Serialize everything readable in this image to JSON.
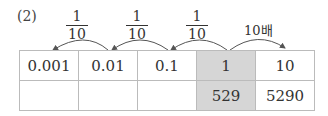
{
  "problem_label": "(2)",
  "arrows": [
    {
      "num": "1",
      "den": "10",
      "direction": "left"
    },
    {
      "num": "1",
      "den": "10",
      "direction": "left"
    },
    {
      "num": "1",
      "den": "10",
      "direction": "left"
    },
    {
      "text": "10배",
      "direction": "right"
    }
  ],
  "table": {
    "row1": [
      "0.001",
      "0.01",
      "0.1",
      "1",
      "10"
    ],
    "row2": [
      "",
      "",
      "",
      "529",
      "5290"
    ],
    "highlight_column": 3,
    "highlight_color": "#d6d6d6"
  }
}
